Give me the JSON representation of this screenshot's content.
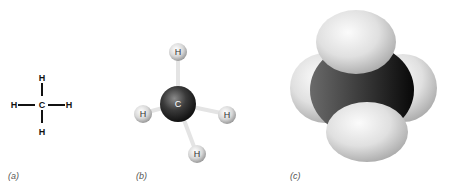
{
  "figure": {
    "panels": [
      {
        "id": "a",
        "label": "(a)",
        "type": "structural-formula",
        "center": "C",
        "substituents": [
          "H",
          "H",
          "H",
          "H"
        ]
      },
      {
        "id": "b",
        "label": "(b)",
        "type": "ball-and-stick",
        "center": "C",
        "substituents": [
          "H",
          "H",
          "H",
          "H"
        ]
      },
      {
        "id": "c",
        "label": "(c)",
        "type": "space-filling"
      }
    ],
    "colors": {
      "carbon": "#2a2a2a",
      "hydrogen": "#e6e6e6",
      "bond_line": "#111111",
      "label_text": "#555555"
    }
  }
}
